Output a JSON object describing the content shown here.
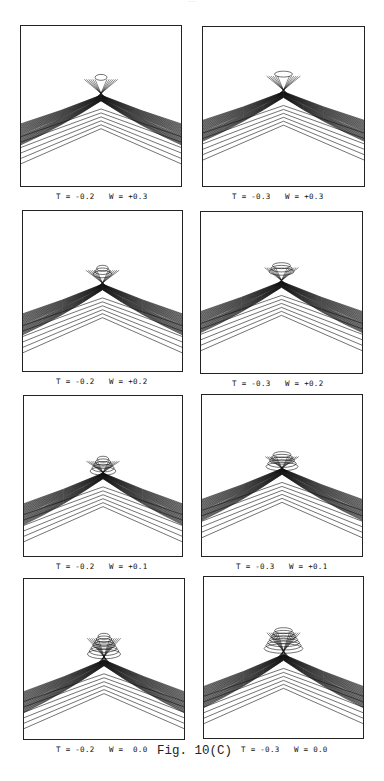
{
  "page": {
    "page_number": "...",
    "figure_caption": "Fig. 10(C)"
  },
  "panels": [
    {
      "id": "p1",
      "row": 1,
      "col": 1,
      "label": "T = -0.2   W = +0.3",
      "T": -0.2,
      "W": 0.3
    },
    {
      "id": "p2",
      "row": 1,
      "col": 2,
      "label": "T = -0.3   W = +0.3",
      "T": -0.3,
      "W": 0.3
    },
    {
      "id": "p3",
      "row": 2,
      "col": 1,
      "label": "T = -0.2   W = +0.2",
      "T": -0.2,
      "W": 0.2
    },
    {
      "id": "p4",
      "row": 2,
      "col": 2,
      "label": "T = -0.3   W = +0.2",
      "T": -0.3,
      "W": 0.2
    },
    {
      "id": "p5",
      "row": 3,
      "col": 1,
      "label": "T = -0.2   W = +0.1",
      "T": -0.2,
      "W": 0.1
    },
    {
      "id": "p6",
      "row": 3,
      "col": 2,
      "label": "T = -0.3   W = +0.1",
      "T": -0.3,
      "W": 0.1
    },
    {
      "id": "p7",
      "row": 4,
      "col": 1,
      "label": "T = -0.2   W =  0.0",
      "T": -0.2,
      "W": 0.0
    },
    {
      "id": "p8",
      "row": 4,
      "col": 2,
      "label": "T = -0.3   W = 0.0",
      "T": -0.3,
      "W": 0.0
    }
  ],
  "style": {
    "line_color": "#111111",
    "border_color": "#222222",
    "background": "#ffffff"
  }
}
